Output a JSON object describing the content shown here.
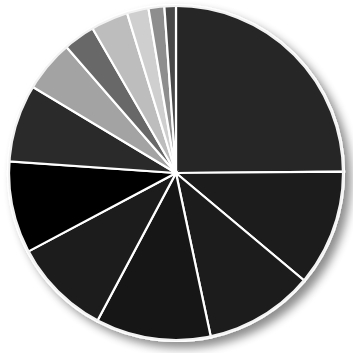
{
  "chart_data": {
    "type": "pie",
    "title": "",
    "subtitle": "",
    "xlabel": "",
    "ylabel": "",
    "legend_position": "none",
    "grid": false,
    "labels_shown": false,
    "center": {
      "x": 176,
      "y": 173
    },
    "radius": 168,
    "start_angle_deg": -90,
    "direction": "clockwise",
    "slice_border_color": "#ffffff",
    "background_color": "#ffffff",
    "has_drop_shadow": true,
    "categories": [
      "Slice 1",
      "Slice 2",
      "Slice 3",
      "Slice 4",
      "Slice 5",
      "Slice 6",
      "Slice 7",
      "Slice 8",
      "Slice 9",
      "Slice 10",
      "Slice 11",
      "Slice 12"
    ],
    "values": [
      25.5,
      11.5,
      10.5,
      11.5,
      9.5,
      9.0,
      7.5,
      5.0,
      3.0,
      2.0,
      3.0,
      2.0
    ],
    "units": "percent",
    "total": 100,
    "colors": [
      "#262626",
      "#1b1b1b",
      "#1e1e1e",
      "#191919",
      "#1d1d1d",
      "#040404",
      "#2b2b2b",
      "#a3a3a3",
      "#686868",
      "#bdbdbd",
      "#cfcfcf",
      "#8e8e8e",
      "#4a4a4a"
    ],
    "slices": [
      {
        "label": "Slice 1",
        "value": 25.5,
        "color": "#262626",
        "start_deg": -90.0,
        "end_deg": -0.5
      },
      {
        "label": "Slice 2",
        "value": 11.5,
        "color": "#1b1b1b",
        "start_deg": -0.5,
        "end_deg": 40.0
      },
      {
        "label": "Slice 3",
        "value": 10.5,
        "color": "#1e1e1e",
        "start_deg": 40.0,
        "end_deg": 78.0
      },
      {
        "label": "Slice 4",
        "value": 11.5,
        "color": "#191919",
        "start_deg": 78.0,
        "end_deg": 118.0
      },
      {
        "label": "Slice 5",
        "value": 9.5,
        "color": "#1d1d1d",
        "start_deg": 118.0,
        "end_deg": 152.0
      },
      {
        "label": "Slice 6",
        "value": 9.0,
        "color": "#040404",
        "start_deg": 152.0,
        "end_deg": 184.0
      },
      {
        "label": "Slice 7",
        "value": 7.5,
        "color": "#2b2b2b",
        "start_deg": 184.0,
        "end_deg": 211.0
      },
      {
        "label": "Slice 8",
        "value": 5.0,
        "color": "#a3a3a3",
        "start_deg": 211.0,
        "end_deg": 229.0
      },
      {
        "label": "Slice 9",
        "value": 3.0,
        "color": "#686868",
        "start_deg": 229.0,
        "end_deg": 240.0
      },
      {
        "label": "Slice 10",
        "value": 3.5,
        "color": "#bdbdbd",
        "start_deg": 240.0,
        "end_deg": 253.0
      },
      {
        "label": "Slice 11",
        "value": 2.0,
        "color": "#cfcfcf",
        "start_deg": 253.0,
        "end_deg": 260.5
      },
      {
        "label": "Slice 12",
        "value": 1.5,
        "color": "#8e8e8e",
        "start_deg": 260.5,
        "end_deg": 266.0
      },
      {
        "label": "Slice 13",
        "value": 1.0,
        "color": "#4a4a4a",
        "start_deg": 266.0,
        "end_deg": 270.0
      }
    ]
  }
}
